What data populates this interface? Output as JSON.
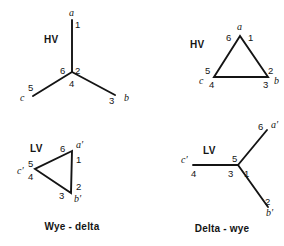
{
  "figure": {
    "background_color": "#ffffff",
    "line_color": "#141414",
    "width": 284,
    "height": 246
  },
  "panels": [
    {
      "id": "hv-wye",
      "side_label": "HV",
      "shape": "wye",
      "terminal_numbers": [
        "1",
        "6",
        "2",
        "4",
        "5",
        "3"
      ],
      "phase_labels": [
        "a",
        "c",
        "b"
      ]
    },
    {
      "id": "lv-delta",
      "side_label": "LV",
      "shape": "delta",
      "terminal_numbers": [
        "6",
        "1",
        "5",
        "4",
        "2",
        "3"
      ],
      "phase_labels": [
        "a′",
        "c′",
        "b′"
      ]
    },
    {
      "id": "hv-delta",
      "side_label": "HV",
      "shape": "delta",
      "terminal_numbers": [
        "6",
        "1",
        "5",
        "4",
        "2",
        "3"
      ],
      "phase_labels": [
        "a",
        "c",
        "b"
      ]
    },
    {
      "id": "lv-wye",
      "side_label": "LV",
      "shape": "wye",
      "terminal_numbers": [
        "6",
        "5",
        "4",
        "3",
        "1",
        "2"
      ],
      "phase_labels": [
        "a′",
        "c′",
        "b′"
      ]
    }
  ],
  "captions": {
    "left": "Wye - delta",
    "right": "Delta - wye"
  },
  "labels": {
    "hv_wye": {
      "side": "HV",
      "n1": "1",
      "n6": "6",
      "n2": "2",
      "n4": "4",
      "n5": "5",
      "n3": "3",
      "pa": "a",
      "pc": "c",
      "pb": "b"
    },
    "hv_delta": {
      "side": "HV",
      "n6": "6",
      "n1": "1",
      "n5": "5",
      "n4": "4",
      "n2": "2",
      "n3": "3",
      "pa": "a",
      "pc": "c",
      "pb": "b"
    },
    "lv_delta": {
      "side": "LV",
      "n6": "6",
      "n1": "1",
      "n5": "5",
      "n4": "4",
      "n2": "2",
      "n3": "3",
      "pa": "a′",
      "pc": "c′",
      "pb": "b′"
    },
    "lv_wye": {
      "side": "LV",
      "n6": "6",
      "n5": "5",
      "n4": "4",
      "n3": "3",
      "n1": "1",
      "n2": "2",
      "pa": "a′",
      "pc": "c′",
      "pb": "b′"
    }
  }
}
